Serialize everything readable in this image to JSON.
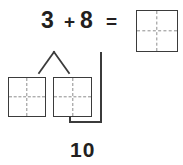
{
  "equation": {
    "addend_a": "3",
    "plus": "+",
    "addend_b": "8",
    "equals": "=",
    "sum": "10"
  },
  "colors": {
    "text": "#231f20",
    "frame_border": "#3b3b3b",
    "dashed_divider": "#8d8d8d",
    "connector": "#3b3b3b",
    "background": "#ffffff"
  },
  "figure": {
    "type": "make-ten-strategy-diagram",
    "answer_box_label": "",
    "left_frame_label": "",
    "right_frame_label": "",
    "decomposition_branch": "splits 3 into two parts",
    "bracket_label": "10"
  }
}
